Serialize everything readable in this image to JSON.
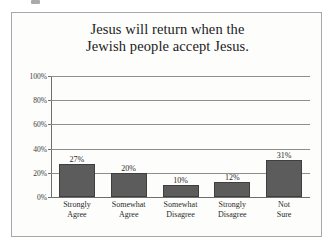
{
  "figure": {
    "background_color": "#fdfdfc",
    "border_color": "#a8a8a8"
  },
  "chart_data": {
    "type": "bar",
    "title": "Jesus will return when the Jewish people accept Jesus.",
    "title_lines": [
      "Jesus will return when the",
      "Jewish people accept Jesus."
    ],
    "categories": [
      "Strongly Agree",
      "Somewhat Agree",
      "Somewhat Disagree",
      "Strongly Disagree",
      "Not Sure"
    ],
    "category_lines": [
      [
        "Strongly",
        "Agree"
      ],
      [
        "Somewhat",
        "Agree"
      ],
      [
        "Somewhat",
        "Disagree"
      ],
      [
        "Strongly",
        "Disagree"
      ],
      [
        "Not",
        "Sure"
      ]
    ],
    "values": [
      27,
      20,
      10,
      12,
      31
    ],
    "value_labels": [
      "27%",
      "20%",
      "10%",
      "12%",
      "31%"
    ],
    "xlabel": "",
    "ylabel": "",
    "ylim": [
      0,
      100
    ],
    "y_ticks": [
      0,
      20,
      40,
      60,
      80,
      100
    ],
    "y_tick_labels": [
      "0%",
      "20%",
      "40%",
      "60%",
      "80%",
      "100%"
    ],
    "grid": true,
    "grid_axis": "y",
    "legend": false,
    "bar_color": "#5c5c5c",
    "bar_edge_color": "#3f3f3f",
    "gridline_color": "#8e8e8e",
    "axis_color": "#6e6e6e",
    "text_color": "#2a2a2a"
  }
}
